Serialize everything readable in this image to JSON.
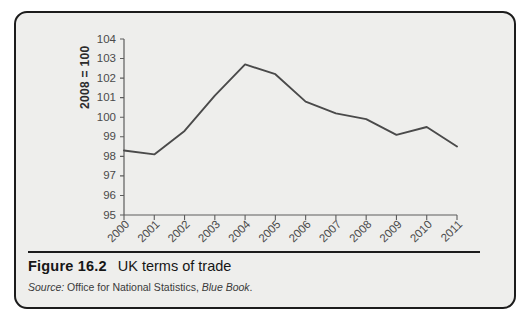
{
  "figure": {
    "number": "Figure 16.2",
    "title": "UK terms of trade",
    "source_label": "Source:",
    "source_body": "Office for National Statistics,",
    "source_italic": "Blue Book",
    "source_period": "."
  },
  "colors": {
    "line": "#4a4a4a",
    "axis": "#5d5d5d",
    "panel_background": "#eeeeec",
    "border": "#1c1c1c",
    "text": "#161616"
  },
  "chart_data": {
    "type": "line",
    "title": "UK terms of trade",
    "xlabel": "",
    "ylabel": "2008 = 100",
    "ylim": [
      95,
      104
    ],
    "ytick_step": 1,
    "yticks": [
      95,
      96,
      97,
      98,
      99,
      100,
      101,
      102,
      103,
      104
    ],
    "grid": false,
    "legend": false,
    "x_tick_rotation_deg": 45,
    "categories": [
      "2000",
      "2001",
      "2002",
      "2003",
      "2004",
      "2005",
      "2006",
      "2007",
      "2008",
      "2009",
      "2010",
      "2011"
    ],
    "values": [
      98.3,
      98.1,
      99.3,
      101.1,
      102.7,
      102.2,
      100.8,
      100.2,
      99.9,
      99.1,
      99.5,
      98.5
    ],
    "series": [
      {
        "name": "UK terms of trade",
        "values": [
          98.3,
          98.1,
          99.3,
          101.1,
          102.7,
          102.2,
          100.8,
          100.2,
          99.9,
          99.1,
          99.5,
          98.5
        ]
      }
    ]
  }
}
